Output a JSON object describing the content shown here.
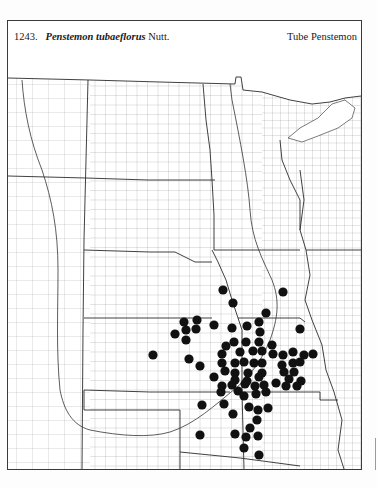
{
  "header": {
    "number": "1243.",
    "scientific_name": "Penstemon tubaeflorus",
    "author": "Nutt.",
    "common_name": "Tube Penstemon"
  },
  "map": {
    "region": "Great Plains (North Dakota to Oklahoma and adjacent states)",
    "line_color": "#555555",
    "state_line_color": "#2b2b2b",
    "dot_color": "#111111",
    "dot_radius": 4.6,
    "frame": {
      "x": 7,
      "y": 20,
      "width": 355,
      "height": 450
    },
    "records": [
      [
        223,
        290
      ],
      [
        233,
        303
      ],
      [
        283,
        292
      ],
      [
        266,
        313
      ],
      [
        184,
        322
      ],
      [
        197,
        320
      ],
      [
        186,
        330
      ],
      [
        196,
        329
      ],
      [
        175,
        334
      ],
      [
        186,
        340
      ],
      [
        214,
        325
      ],
      [
        232,
        328
      ],
      [
        247,
        326
      ],
      [
        259,
        322
      ],
      [
        260,
        332
      ],
      [
        300,
        329
      ],
      [
        226,
        346
      ],
      [
        234,
        342
      ],
      [
        246,
        342
      ],
      [
        259,
        342
      ],
      [
        272,
        345
      ],
      [
        153,
        355
      ],
      [
        222,
        354
      ],
      [
        240,
        352
      ],
      [
        253,
        351
      ],
      [
        262,
        351
      ],
      [
        273,
        354
      ],
      [
        283,
        355
      ],
      [
        293,
        352
      ],
      [
        304,
        355
      ],
      [
        313,
        354
      ],
      [
        189,
        359
      ],
      [
        200,
        366
      ],
      [
        222,
        363
      ],
      [
        235,
        363
      ],
      [
        244,
        362
      ],
      [
        254,
        363
      ],
      [
        262,
        363
      ],
      [
        282,
        365
      ],
      [
        293,
        363
      ],
      [
        300,
        362
      ],
      [
        225,
        371
      ],
      [
        235,
        373
      ],
      [
        248,
        373
      ],
      [
        262,
        373
      ],
      [
        284,
        372
      ],
      [
        294,
        372
      ],
      [
        214,
        377
      ],
      [
        235,
        380
      ],
      [
        247,
        381
      ],
      [
        259,
        377
      ],
      [
        289,
        379
      ],
      [
        301,
        381
      ],
      [
        222,
        386
      ],
      [
        232,
        385
      ],
      [
        245,
        384
      ],
      [
        255,
        386
      ],
      [
        264,
        385
      ],
      [
        276,
        383
      ],
      [
        286,
        386
      ],
      [
        297,
        386
      ],
      [
        221,
        392
      ],
      [
        238,
        391
      ],
      [
        244,
        396
      ],
      [
        256,
        394
      ],
      [
        266,
        392
      ],
      [
        202,
        405
      ],
      [
        224,
        404
      ],
      [
        249,
        407
      ],
      [
        258,
        410
      ],
      [
        268,
        408
      ],
      [
        233,
        414
      ],
      [
        257,
        420
      ],
      [
        250,
        428
      ],
      [
        200,
        435
      ],
      [
        235,
        434
      ],
      [
        246,
        437
      ],
      [
        258,
        436
      ],
      [
        244,
        448
      ],
      [
        259,
        455
      ]
    ]
  }
}
